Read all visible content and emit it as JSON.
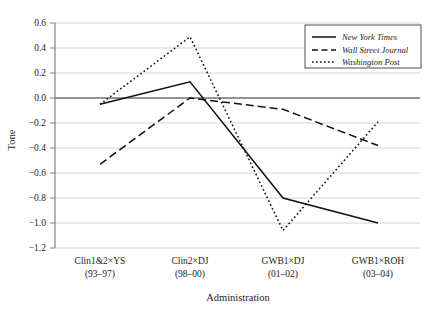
{
  "chart_data": {
    "type": "line",
    "title": "",
    "xlabel": "Administration",
    "ylabel": "Tone",
    "categories": [
      "Clin1&2×YS",
      "Clin2×DJ",
      "GWB1×DJ",
      "GWB1×ROH"
    ],
    "category_sublabels": [
      "(93–97)",
      "(98–00)",
      "(01–02)",
      "(03–04)"
    ],
    "series": [
      {
        "name": "New York Times",
        "values": [
          -0.05,
          0.13,
          -0.8,
          -1.0
        ],
        "style": "solid"
      },
      {
        "name": "Wall Street Journal",
        "values": [
          -0.53,
          0.0,
          -0.09,
          -0.38
        ],
        "style": "dashed"
      },
      {
        "name": "Washington Post",
        "values": [
          -0.05,
          0.49,
          -1.06,
          -0.19
        ],
        "style": "dotted"
      }
    ],
    "ylim": [
      -1.2,
      0.6
    ],
    "yticks": [
      0.6,
      0.4,
      0.2,
      0.0,
      -0.2,
      -0.4,
      -0.6,
      -0.8,
      -1.0,
      -1.2
    ],
    "ytick_labels": [
      "0.6",
      "0.4",
      "0.2",
      "0.0",
      "−0.2",
      "−0.4",
      "−0.6",
      "−0.8",
      "−1.0",
      "−1.2"
    ],
    "grid": true,
    "legend_position": "top-right",
    "zero_reference_line": 0.0,
    "line_color": "#111111",
    "grid_color": "#c9c9c9"
  },
  "legend": {
    "entries": [
      {
        "label": "New York Times"
      },
      {
        "label": "Wall Street Journal"
      },
      {
        "label": "Washington Post"
      }
    ]
  }
}
